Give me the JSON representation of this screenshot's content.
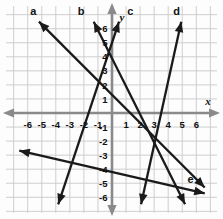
{
  "figure": {
    "kind": "coordinate-plane-line-graph",
    "background_color": "#fdfdfd",
    "grid_color": "#c9c9c9",
    "axis_color": "#8a8a8a",
    "line_color": "#1a1a1a"
  },
  "axes": {
    "x_label": "x",
    "y_label": "y",
    "x_tick_labels": [
      "-6",
      "-5",
      "-4",
      "-3",
      "-2",
      "-1",
      "1",
      "2",
      "3",
      "4",
      "5",
      "6"
    ],
    "y_tick_labels": [
      "6",
      "5",
      "4",
      "3",
      "2",
      "1",
      "-1",
      "-2",
      "-3",
      "-4",
      "-5",
      "-6"
    ],
    "x_range": [
      -6.6,
      6.6
    ],
    "y_range": [
      -6.6,
      6.6
    ],
    "grid": true,
    "grid_step": 1
  },
  "line_labels": {
    "a": "a",
    "b": "b",
    "c": "c",
    "d": "d",
    "e": "e"
  },
  "chart_data": {
    "type": "line",
    "title": "",
    "xlabel": "x",
    "ylabel": "y",
    "xlim": [
      -6.6,
      6.6
    ],
    "ylim": [
      -6.6,
      6.6
    ],
    "grid": true,
    "legend": "inline-endpoint-labels",
    "series": [
      {
        "name": "a",
        "label": "a",
        "slope": -1,
        "y_intercept": 1.3,
        "x_intercept": 1.3,
        "endpoints": [
          [
            -5.2,
            6.5
          ],
          [
            6.6,
            -5.3
          ]
        ],
        "arrow_start": true,
        "arrow_end": true,
        "label_position": [
          -5.6,
          7.0
        ]
      },
      {
        "name": "b",
        "label": "b",
        "slope": -2,
        "y_intercept": 3.9,
        "x_intercept": 1.95,
        "endpoints": [
          [
            -1.3,
            6.5
          ],
          [
            5.2,
            -6.5
          ]
        ],
        "arrow_start": true,
        "arrow_end": true,
        "label_position": [
          -2.2,
          7.0
        ]
      },
      {
        "name": "c",
        "label": "c",
        "slope": 3,
        "y_intercept": 5,
        "x_intercept": -1.67,
        "endpoints": [
          [
            -3.83,
            -6.5
          ],
          [
            0.5,
            6.5
          ]
        ],
        "arrow_start": true,
        "arrow_end": true,
        "label_position": [
          1.3,
          7.0
        ]
      },
      {
        "name": "d",
        "label": "d",
        "slope": 7,
        "y_intercept": -21,
        "x_intercept": 3,
        "endpoints": [
          [
            2.07,
            -6.5
          ],
          [
            4.93,
            6.5
          ]
        ],
        "arrow_start": true,
        "arrow_end": true,
        "label_position": [
          4.6,
          7.0
        ]
      },
      {
        "name": "e",
        "label": "e",
        "slope": -0.23,
        "y_intercept": -4.2,
        "x_intercept": -18.3,
        "endpoints": [
          [
            -6.6,
            -2.68
          ],
          [
            6.6,
            -5.72
          ]
        ],
        "arrow_start": true,
        "arrow_end": true,
        "label_position": [
          5.6,
          -5.0
        ]
      }
    ]
  }
}
